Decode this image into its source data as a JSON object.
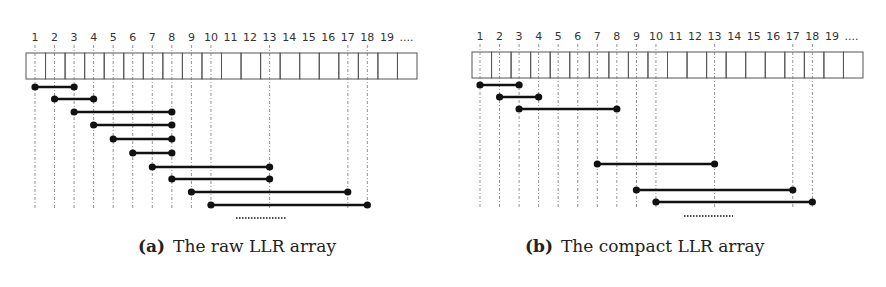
{
  "figure": {
    "panels": [
      {
        "id": "a",
        "label": "(a)",
        "caption": "The raw LLR array",
        "array": {
          "x": 26,
          "y": 53,
          "cell_w": 19.55,
          "cell_h": 26,
          "cells": 20
        },
        "line_x0": 35,
        "line_bottom": 209,
        "index_labels": [
          "1",
          "2",
          "3",
          "4",
          "5",
          "6",
          "7",
          "8",
          "9",
          "10",
          "11",
          "12",
          "13",
          "14",
          "15",
          "16",
          "17",
          "18",
          "19",
          "...."
        ],
        "guide_lines": [
          1,
          2,
          3,
          4,
          5,
          6,
          7,
          8,
          9,
          10,
          13,
          17,
          18
        ],
        "segments": [
          {
            "from": 1,
            "to": 3,
            "y": 87
          },
          {
            "from": 2,
            "to": 4,
            "y": 99
          },
          {
            "from": 3,
            "to": 8,
            "y": 112
          },
          {
            "from": 4,
            "to": 8,
            "y": 125
          },
          {
            "from": 5,
            "to": 8,
            "y": 139
          },
          {
            "from": 6,
            "to": 8,
            "y": 153
          },
          {
            "from": 7,
            "to": 13,
            "y": 167
          },
          {
            "from": 8,
            "to": 13,
            "y": 179
          },
          {
            "from": 9,
            "to": 17,
            "y": 192
          },
          {
            "from": 10,
            "to": 18,
            "y": 205
          }
        ],
        "ellipsis": {
          "x1": 236,
          "x2": 286,
          "y": 218
        }
      },
      {
        "id": "b",
        "label": "(b)",
        "caption": "The compact LLR array",
        "array": {
          "x": 472,
          "y": 52,
          "cell_w": 19.55,
          "cell_h": 26,
          "cells": 20
        },
        "line_x0": 480,
        "line_bottom": 207,
        "index_labels": [
          "1",
          "2",
          "3",
          "4",
          "5",
          "6",
          "7",
          "8",
          "9",
          "10",
          "11",
          "12",
          "13",
          "14",
          "15",
          "16",
          "17",
          "18",
          "19",
          "...."
        ],
        "guide_lines": [
          1,
          2,
          3,
          4,
          5,
          6,
          7,
          8,
          9,
          10,
          13,
          17,
          18
        ],
        "segments": [
          {
            "from": 1,
            "to": 3,
            "y": 85
          },
          {
            "from": 2,
            "to": 4,
            "y": 97
          },
          {
            "from": 3,
            "to": 8,
            "y": 109
          },
          {
            "from": 7,
            "to": 13,
            "y": 164
          },
          {
            "from": 9,
            "to": 17,
            "y": 190
          },
          {
            "from": 10,
            "to": 18,
            "y": 202
          }
        ],
        "ellipsis": {
          "x1": 684,
          "x2": 733,
          "y": 216
        }
      }
    ],
    "colors": {
      "ink": "#111111",
      "grid": "#555555",
      "guide": "#777777",
      "label": "#333333"
    }
  }
}
